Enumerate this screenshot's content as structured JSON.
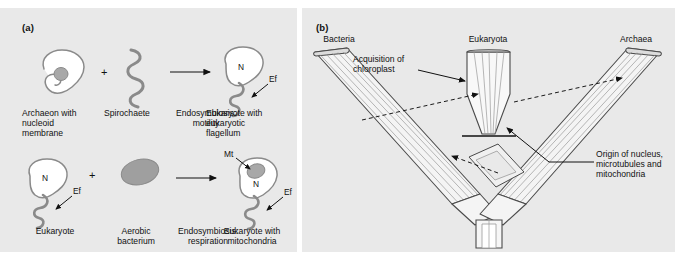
{
  "figure": {
    "background": "#ffffff",
    "panel_background": "#e9e9e9",
    "line_color": "#7d7d7d",
    "ink_color": "#111111",
    "cell_fill": "#ffffff",
    "organelle_fill": "#a8a8a8",
    "branch_fill": "#f2f2f2"
  },
  "panel_a": {
    "label": "(a)",
    "row1": {
      "plus": "+",
      "items": [
        {
          "name": "archaeon-cell",
          "caption": "Archaeon with\nnucleoid\nmembrane",
          "caption_line1": "Archaeon with",
          "caption_line2": "nucleoid",
          "caption_line3": "membrane"
        },
        {
          "name": "spirochaete",
          "caption_line1": "Spirochaete",
          "caption_line2": "",
          "caption_line3": ""
        },
        {
          "name": "process-arrow",
          "caption_line1": "Endosymbiosis:",
          "caption_line2": "motility",
          "caption_line3": ""
        },
        {
          "name": "eukaryote-flagellum-cell",
          "caption_line1": "Eukaryote with",
          "caption_line2": "eukaryotic",
          "caption_line3": "flagellum"
        }
      ],
      "nucleus_tag": "N",
      "flagellum_tag": "Ef"
    },
    "row2": {
      "plus": "+",
      "items": [
        {
          "name": "eukaryote-cell",
          "caption_line1": "Eukaryote",
          "caption_line2": "",
          "caption_line3": ""
        },
        {
          "name": "aerobic-bacterium",
          "caption_line1": "Aerobic",
          "caption_line2": "bacterium",
          "caption_line3": ""
        },
        {
          "name": "process-arrow",
          "caption_line1": "Endosymbiosis:",
          "caption_line2": "respiration",
          "caption_line3": ""
        },
        {
          "name": "eukaryote-mitochondria-cell",
          "caption_line1": "Eukaryote with",
          "caption_line2": "mitochondria",
          "caption_line3": ""
        }
      ],
      "nucleus_tag": "N",
      "flagellum_tag": "Ef",
      "mitochondrion_tag": "Mt"
    }
  },
  "panel_b": {
    "label": "(b)",
    "domains": [
      {
        "name": "bacteria-branch",
        "label": "Bacteria"
      },
      {
        "name": "eukaryota-branch",
        "label": "Eukaryota"
      },
      {
        "name": "archaea-branch",
        "label": "Archaea"
      }
    ],
    "annotations": [
      {
        "name": "acquisition-of-chloroplast",
        "line1": "Acquisition of",
        "line2": "chloroplast",
        "line3": ""
      },
      {
        "name": "origin-of-nucleus",
        "line1": "Origin of nucleus,",
        "line2": "microtubules and",
        "line3": "mitochondria"
      }
    ]
  }
}
